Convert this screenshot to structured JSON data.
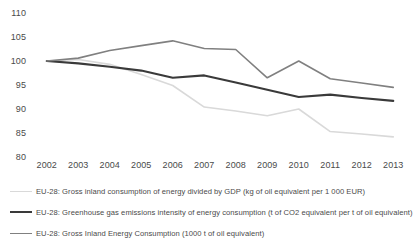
{
  "chart_data": {
    "type": "line",
    "title": "",
    "subtitle": "",
    "xlabel": "",
    "ylabel": "",
    "categories": [
      "2002",
      "2003",
      "2004",
      "2005",
      "2006",
      "2007",
      "2008",
      "2009",
      "2010",
      "2011",
      "2012",
      "2013"
    ],
    "x": [
      2002,
      2003,
      2004,
      2005,
      2006,
      2007,
      2008,
      2009,
      2010,
      2011,
      2012,
      2013
    ],
    "ylim": [
      80,
      110
    ],
    "yticks": [
      80,
      85,
      90,
      95,
      100,
      105,
      110
    ],
    "grid": false,
    "legend_position": "bottom",
    "series": [
      {
        "name": "EU-28: Gross inland consumption of energy divided by GDP (kg of oil equivalent per 1 000 EUR)",
        "color": "#d9d9d9",
        "width": 1.6,
        "values": [
          100.0,
          100.3,
          99.3,
          97.2,
          94.9,
          90.4,
          89.6,
          88.6,
          90.0,
          85.3,
          84.8,
          84.2
        ]
      },
      {
        "name": "EU-28: Greenhouse gas emissions intensity of energy consumption (t of CO2 equivalent per t of oil equivalent)",
        "color": "#3a3a3a",
        "width": 2.1,
        "values": [
          100.0,
          99.5,
          98.8,
          98.0,
          96.5,
          97.0,
          95.5,
          94.0,
          92.5,
          93.0,
          92.3,
          91.7
        ]
      },
      {
        "name": "EU-28: Gross Inland Energy Consumption (1000 t of oil equivalent)",
        "color": "#808080",
        "width": 1.6,
        "values": [
          100.0,
          100.6,
          102.2,
          103.2,
          104.2,
          102.6,
          102.4,
          96.5,
          100.0,
          96.3,
          95.4,
          94.5
        ]
      }
    ]
  },
  "axis": {
    "y_ticks": [
      "110",
      "105",
      "100",
      "95",
      "90",
      "85",
      "80"
    ],
    "x_ticks": [
      "2002",
      "2003",
      "2004",
      "2005",
      "2006",
      "2007",
      "2008",
      "2009",
      "2010",
      "2011",
      "2012",
      "2013"
    ]
  },
  "legend": {
    "items": [
      {
        "label": "EU-28: Gross inland consumption of energy divided by GDP (kg of oil equivalent per 1 000 EUR)",
        "color": "#d9d9d9",
        "thickness": "1.6px"
      },
      {
        "label": "EU-28: Greenhouse gas emissions intensity of energy consumption (t of CO2 equivalent per t of oil equivalent)",
        "color": "#3a3a3a",
        "thickness": "2.4px"
      },
      {
        "label": "EU-28: Gross Inland Energy Consumption (1000 t of oil equivalent)",
        "color": "#808080",
        "thickness": "1.6px"
      }
    ]
  }
}
